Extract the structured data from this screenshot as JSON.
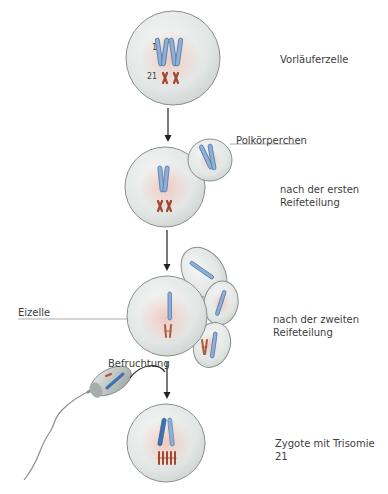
{
  "diagram": {
    "stages": [
      {
        "id": "precursor",
        "label": "Vorläuferzelle"
      },
      {
        "id": "first-division",
        "label_line1": "nach der ersten",
        "label_line2": "Reifeteilung"
      },
      {
        "id": "second-division",
        "label_line1": "nach der zweiten",
        "label_line2": "Reifeteilung"
      },
      {
        "id": "zygote",
        "label": "Zygote mit Trisomie 21"
      }
    ],
    "callouts": {
      "polar_body": "Polkörperchen",
      "egg_cell": "Eizelle",
      "fertilization": "Befruchtung"
    },
    "chromosome_labels": {
      "chr1": "1",
      "chr21": "21"
    },
    "colors": {
      "cell_fill": "#e4e8e6",
      "cell_stroke": "#8a8f8c",
      "nucleus_tint": "#f0c8c0",
      "chromosome_1": "#7f9fc6",
      "chromosome_1_dark": "#3f70b0",
      "chromosome_21": "#b0503a",
      "arrow": "#222222"
    }
  }
}
